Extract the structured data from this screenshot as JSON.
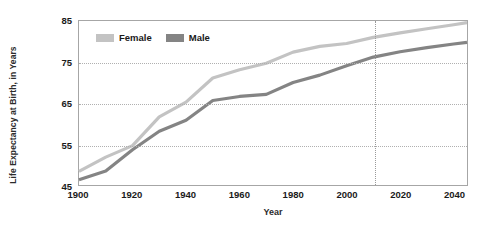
{
  "chart_data": {
    "type": "line",
    "title": "",
    "xlabel": "Year",
    "ylabel": "Life Expectancy at Birth, in Years",
    "xlim": [
      1900,
      2045
    ],
    "ylim": [
      45,
      85
    ],
    "grid": "horizontal-dotted-plus-projection-line",
    "legend_position": "top-left-inside",
    "x_ticks": [
      1900,
      1920,
      1940,
      1960,
      1980,
      2000,
      2020,
      2040
    ],
    "y_ticks": [
      45,
      55,
      65,
      75,
      85
    ],
    "annotations": [
      {
        "name": "projection-divider",
        "type": "vertical-line",
        "x": 2010,
        "style": "dotted"
      }
    ],
    "series": [
      {
        "name": "Female",
        "color": "#c3c3c3",
        "x": [
          1900,
          1910,
          1920,
          1930,
          1940,
          1950,
          1960,
          1970,
          1980,
          1990,
          2000,
          2010,
          2020,
          2030,
          2040,
          2045
        ],
        "values": [
          48.3,
          51.8,
          54.6,
          61.6,
          65.2,
          71.1,
          73.1,
          74.7,
          77.4,
          78.8,
          79.5,
          81.0,
          82.1,
          83.1,
          84.1,
          84.6
        ]
      },
      {
        "name": "Male",
        "color": "#848484",
        "x": [
          1900,
          1910,
          1920,
          1930,
          1940,
          1950,
          1960,
          1970,
          1980,
          1990,
          2000,
          2010,
          2020,
          2030,
          2040,
          2045
        ],
        "values": [
          46.3,
          48.4,
          53.6,
          58.1,
          60.8,
          65.6,
          66.6,
          67.1,
          70.0,
          71.8,
          74.1,
          76.2,
          77.5,
          78.5,
          79.4,
          79.8
        ]
      }
    ]
  },
  "legend": {
    "items": [
      {
        "label": "Female",
        "color": "#c3c3c3"
      },
      {
        "label": "Male",
        "color": "#848484"
      }
    ]
  },
  "axes": {
    "y_title": "Life Expectancy at Birth, in Years",
    "x_title": "Year",
    "y_tick_labels": [
      "85",
      "75",
      "65",
      "55",
      "45"
    ],
    "x_tick_labels": [
      "1900",
      "1920",
      "1940",
      "1960",
      "1980",
      "2000",
      "2020",
      "2040"
    ]
  },
  "colors": {
    "female": "#c3c3c3",
    "male": "#848484",
    "frame": "#a6a6a6",
    "gridline": "#b0b0b0",
    "text": "#1a1a1a",
    "background": "#ffffff"
  }
}
